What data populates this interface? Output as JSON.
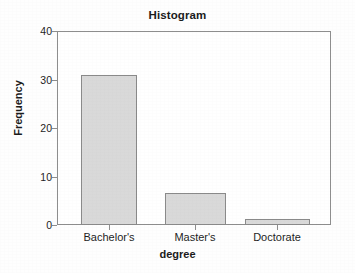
{
  "chart_data": {
    "type": "bar",
    "title": "Histogram",
    "xlabel": "degree",
    "ylabel": "Frequency",
    "categories": [
      "Bachelor's",
      "Master's",
      "Doctorate"
    ],
    "values": [
      31,
      6.5,
      1.2
    ],
    "ylim": [
      0,
      40
    ],
    "yticks": [
      0,
      10,
      20,
      30,
      40
    ],
    "ytick_labels": [
      "0",
      "10",
      "20",
      "30",
      "40"
    ],
    "grid": false,
    "legend": false,
    "bar_fill_color": "#d9d9d9",
    "bar_edge_color": "#8a8a8a",
    "axis_color": "#8e8e8e",
    "text_color": "#1f1f1f",
    "background_color": "#ffffff"
  },
  "axis": {
    "y_ticks": [
      {
        "label": "40",
        "value": 40
      },
      {
        "label": "30",
        "value": 30
      },
      {
        "label": "20",
        "value": 20
      },
      {
        "label": "10",
        "value": 10
      },
      {
        "label": "0",
        "value": 0
      }
    ],
    "x_ticks": [
      {
        "label": "Bachelor's",
        "center_px": 109
      },
      {
        "label": "Master's",
        "center_px": 195
      },
      {
        "label": "Doctorate",
        "center_px": 277
      }
    ]
  },
  "bars": [
    {
      "label": "Bachelor's",
      "value": 31,
      "left_px": 24,
      "width_px": 56
    },
    {
      "label": "Master's",
      "value": 6.5,
      "left_px": 108,
      "width_px": 61
    },
    {
      "label": "Doctorate",
      "value": 1.2,
      "left_px": 188,
      "width_px": 65
    }
  ]
}
